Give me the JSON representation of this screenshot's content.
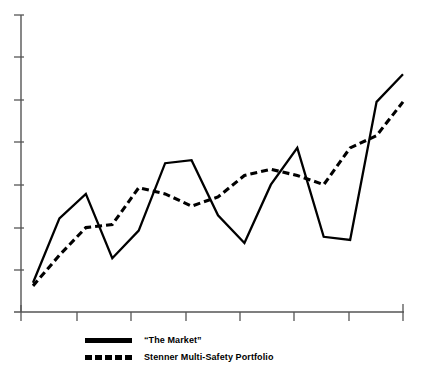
{
  "chart_data": {
    "type": "line",
    "title": "",
    "subtitle": "",
    "xlabel": "",
    "ylabel": "",
    "grid": false,
    "legend_position": "below-left",
    "xlim": [
      0,
      14
    ],
    "ylim": [
      0,
      100
    ],
    "x_tick_count": 8,
    "y_tick_count": 7,
    "x_tick_labels": [
      "",
      "",
      "",
      "",
      "",
      "",
      "",
      ""
    ],
    "y_tick_labels": [
      "",
      "",
      "",
      "",
      "",
      "",
      ""
    ],
    "x": [
      0,
      1,
      2,
      3,
      4,
      5,
      6,
      7,
      8,
      9,
      10,
      11,
      12,
      13,
      14
    ],
    "series": [
      {
        "name": "“The Market”",
        "style": "solid",
        "color": "#000000",
        "values": [
          13,
          34,
          42,
          21,
          30,
          52,
          53,
          35,
          26,
          45,
          57,
          28,
          27,
          72,
          81
        ]
      },
      {
        "name": "Stenner Multi-Safety Portfolio",
        "style": "dashed",
        "color": "#000000",
        "values": [
          12,
          22,
          31,
          32,
          44,
          42,
          38,
          41,
          48,
          50,
          48,
          45,
          57,
          61,
          72
        ]
      }
    ]
  },
  "legend": {
    "items": [
      {
        "label": "“The Market”",
        "style": "solid"
      },
      {
        "label": "Stenner Multi-Safety Portfolio",
        "style": "dashed"
      }
    ]
  },
  "axes": {
    "y_axis_name": "y-axis",
    "x_axis_name": "x-axis"
  }
}
